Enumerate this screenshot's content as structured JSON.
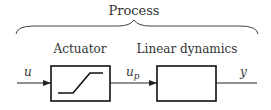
{
  "diagram": {
    "title": "Process",
    "blocks": [
      {
        "id": "actuator",
        "label": "Actuator",
        "icon": "saturation-icon"
      },
      {
        "id": "linear",
        "label": "Linear dynamics"
      }
    ],
    "signals": {
      "input": "u",
      "intermediate_main": "u",
      "intermediate_sub": "p",
      "output": "y"
    },
    "colors": {
      "line": "#222222",
      "text": "#333333",
      "background": "#ffffff"
    }
  }
}
